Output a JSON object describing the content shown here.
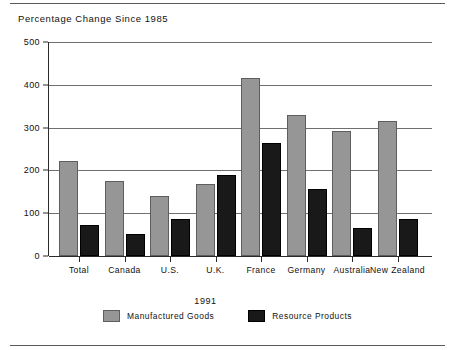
{
  "chart_data": {
    "type": "bar",
    "title": "Percentage Change Since 1985",
    "xlabel": "1991",
    "ylabel": "",
    "ylim": [
      0,
      500
    ],
    "yticks": [
      0,
      100,
      200,
      300,
      400,
      500
    ],
    "ytick_labels": [
      "0",
      "100",
      "200",
      "300",
      "400",
      "500"
    ],
    "grid": true,
    "legend_position": "bottom",
    "categories": [
      "Total",
      "Canada",
      "U.S.",
      "U.K.",
      "France",
      "Germany",
      "Australia",
      "New Zealand"
    ],
    "series": [
      {
        "name": "Manufactured Goods",
        "color": "#969696",
        "values": [
          223,
          175,
          140,
          168,
          417,
          330,
          291,
          316
        ]
      },
      {
        "name": "Resource Products",
        "color": "#191919",
        "values": [
          73,
          52,
          86,
          189,
          263,
          157,
          65,
          86
        ]
      }
    ]
  },
  "legend": {
    "items": [
      {
        "label": "Manufactured Goods",
        "swatch": "manufactured"
      },
      {
        "label": "Resource Products",
        "swatch": "resource"
      }
    ]
  }
}
